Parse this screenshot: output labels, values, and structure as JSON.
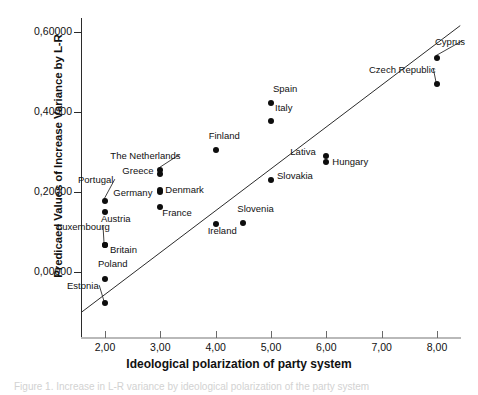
{
  "chart_data": {
    "type": "scatter",
    "title": "",
    "xlabel": "Ideological polarization of party system",
    "ylabel": "Predicaed Values of Increase Variance by L-R",
    "xlim": [
      1.55,
      8.45
    ],
    "ylim": [
      -0.105,
      0.665
    ],
    "xticks": [
      "2,00",
      "3,00",
      "4,00",
      "5,00",
      "6,00",
      "7,00",
      "8,00"
    ],
    "xtick_values": [
      2.0,
      3.0,
      4.0,
      5.0,
      6.0,
      7.0,
      8.0
    ],
    "yticks": [
      "0,60000",
      "0,40000",
      "0,20000",
      "0,00000"
    ],
    "ytick_values": [
      0.6,
      0.4,
      0.2,
      0.0
    ],
    "grid": false,
    "legend": "none",
    "decimal_separator": ",",
    "fit_line": {
      "type": "linear",
      "x_start": 1.58,
      "y_start": -0.1,
      "x_end": 8.42,
      "y_end": 0.616
    },
    "marker_color": "#0d0d0d",
    "points": [
      {
        "label": "Estonia",
        "x": 2.0,
        "y": -0.078,
        "label_dx": -38,
        "label_dy": -17,
        "leader": true
      },
      {
        "label": "Poland",
        "x": 2.0,
        "y": -0.018,
        "label_dx": -7,
        "label_dy": -15,
        "leader": false
      },
      {
        "label": "Luxembourg",
        "x": 2.0,
        "y": 0.068,
        "label_dx": -48,
        "label_dy": -18,
        "leader": true
      },
      {
        "label": "Britain",
        "x": 2.0,
        "y": 0.068,
        "label_dx": 5,
        "label_dy": 5,
        "leader": false
      },
      {
        "label": "Austria",
        "x": 2.0,
        "y": 0.15,
        "label_dx": -4,
        "label_dy": 7,
        "leader": false
      },
      {
        "label": "Portugal",
        "x": 2.0,
        "y": 0.177,
        "label_dx": -27,
        "label_dy": -21,
        "leader": true
      },
      {
        "label": "France",
        "x": 3.0,
        "y": 0.163,
        "label_dx": 2,
        "label_dy": 6,
        "leader": false
      },
      {
        "label": "Germany",
        "x": 3.0,
        "y": 0.2,
        "label_dx": -47,
        "label_dy": 1,
        "leader": false
      },
      {
        "label": "Denmark",
        "x": 3.0,
        "y": 0.204,
        "label_dx": 5,
        "label_dy": 0,
        "leader": false
      },
      {
        "label": "Greece",
        "x": 3.0,
        "y": 0.244,
        "label_dx": -38,
        "label_dy": -3,
        "leader": false
      },
      {
        "label": "The Netherlands",
        "x": 3.0,
        "y": 0.256,
        "label_dx": -50,
        "label_dy": -14,
        "leader": true
      },
      {
        "label": "Ireland",
        "x": 4.0,
        "y": 0.119,
        "label_dx": -8,
        "label_dy": 7,
        "leader": false
      },
      {
        "label": "Finland",
        "x": 4.0,
        "y": 0.305,
        "label_dx": -7,
        "label_dy": -14,
        "leader": false
      },
      {
        "label": "Slovenia",
        "x": 4.5,
        "y": 0.123,
        "label_dx": -6,
        "label_dy": -14,
        "leader": false
      },
      {
        "label": "Slovakia",
        "x": 5.0,
        "y": 0.231,
        "label_dx": 6,
        "label_dy": -4,
        "leader": false
      },
      {
        "label": "Italy",
        "x": 5.0,
        "y": 0.377,
        "label_dx": 4,
        "label_dy": -13,
        "leader": false
      },
      {
        "label": "Spain",
        "x": 5.0,
        "y": 0.422,
        "label_dx": 2,
        "label_dy": -14,
        "leader": false
      },
      {
        "label": "Hungary",
        "x": 6.0,
        "y": 0.274,
        "label_dx": 6,
        "label_dy": 0,
        "leader": false
      },
      {
        "label": "Lativa",
        "x": 6.0,
        "y": 0.289,
        "label_dx": -36,
        "label_dy": -4,
        "leader": false
      },
      {
        "label": "Czech Republic",
        "x": 8.0,
        "y": 0.47,
        "label_dx": -68,
        "label_dy": -14,
        "leader": true
      },
      {
        "label": "Cyprus",
        "x": 8.0,
        "y": 0.536,
        "label_dx": -2,
        "label_dy": -16,
        "leader": true
      }
    ]
  },
  "caption": {
    "text": "Figure 1. Increase in L-R variance by ideological polarization of the party system"
  }
}
